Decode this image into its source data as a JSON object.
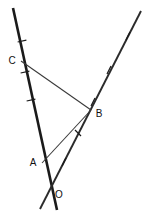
{
  "figure": {
    "type": "geometry-diagram",
    "width": 150,
    "height": 221,
    "background_color": "#ffffff",
    "stroke_color": "#1a1a1a",
    "points": [
      {
        "name": "C",
        "label": "C",
        "x": 21,
        "y": 61,
        "label_x": 12,
        "label_y": 61
      },
      {
        "name": "B",
        "label": "B",
        "x": 91,
        "y": 110,
        "label_x": 98,
        "label_y": 113
      },
      {
        "name": "A",
        "label": "A",
        "x": 42,
        "y": 163,
        "label_x": 33,
        "label_y": 163
      },
      {
        "name": "O",
        "label": "O",
        "x": 51,
        "y": 190,
        "label_x": 58,
        "label_y": 194
      }
    ],
    "lines": [
      {
        "name": "line-through-C-A-O",
        "weight": "thick",
        "x1": 13,
        "y1": 8,
        "x2": 57,
        "y2": 210,
        "tick_count": 3
      },
      {
        "name": "line-through-B-O",
        "weight": "medium",
        "x1": 141,
        "y1": 11,
        "x2": 40,
        "y2": 209,
        "tick_count": 4
      },
      {
        "name": "segment-C-B",
        "weight": "thin",
        "x1": 21,
        "y1": 61,
        "x2": 91,
        "y2": 110,
        "tick_count": 0
      },
      {
        "name": "segment-A-B",
        "weight": "thin",
        "x1": 42,
        "y1": 163,
        "x2": 91,
        "y2": 110,
        "tick_count": 1
      }
    ],
    "tick_marks": [
      {
        "name": "tick-left-upper",
        "cx": 22,
        "cy": 41,
        "angle_deg": 12
      },
      {
        "name": "tick-left-mid",
        "cx": 25,
        "cy": 72,
        "angle_deg": 12
      },
      {
        "name": "tick-left-lower",
        "cx": 31,
        "cy": 100,
        "angle_deg": 12
      },
      {
        "name": "tick-right-top",
        "cx": 128,
        "cy": 36,
        "angle_deg": -63
      },
      {
        "name": "tick-right-upper",
        "cx": 109,
        "cy": 70,
        "angle_deg": -63
      },
      {
        "name": "tick-right-mid",
        "cx": 93,
        "cy": 102,
        "angle_deg": -63
      },
      {
        "name": "tick-right-lower",
        "cx": 64,
        "cy": 162,
        "angle_deg": -63
      },
      {
        "name": "tick-segment-ab",
        "cx": 78,
        "cy": 133,
        "angle_deg": -45
      }
    ],
    "labels": {
      "C": "C",
      "B": "B",
      "A": "A",
      "O": "O"
    }
  }
}
